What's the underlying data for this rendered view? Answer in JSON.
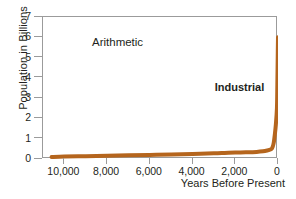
{
  "chart_data": {
    "type": "line",
    "title": "",
    "annotations": [
      {
        "text": "Arithmetic",
        "bold": false
      },
      {
        "text": "Industrial",
        "bold": true
      }
    ],
    "xlabel": "Years Before Present",
    "ylabel": "Population in Billions",
    "xlim": [
      11000,
      0
    ],
    "ylim": [
      0,
      7
    ],
    "x_reversed": true,
    "grid": false,
    "legend": "none",
    "xticks": [
      {
        "value": 10000,
        "label": "10,000"
      },
      {
        "value": 8000,
        "label": "8,000"
      },
      {
        "value": 6000,
        "label": "6,000"
      },
      {
        "value": 4000,
        "label": "4,000"
      },
      {
        "value": 2000,
        "label": "2,000"
      },
      {
        "value": 0,
        "label": "0"
      }
    ],
    "yticks": [
      {
        "value": 0,
        "label": "0"
      },
      {
        "value": 1,
        "label": "1"
      },
      {
        "value": 2,
        "label": "2"
      },
      {
        "value": 3,
        "label": "3"
      },
      {
        "value": 4,
        "label": "4"
      },
      {
        "value": 5,
        "label": "5"
      },
      {
        "value": 6,
        "label": "6"
      },
      {
        "value": 7,
        "label": "7"
      }
    ],
    "series": [
      {
        "name": "World population",
        "color": "#b5651d",
        "line_width": 4,
        "x": [
          10600,
          10000,
          9000,
          8000,
          7000,
          6000,
          5000,
          4000,
          3000,
          2500,
          2000,
          1500,
          1000,
          700,
          500,
          400,
          300,
          250,
          200,
          150,
          100,
          50,
          30,
          10,
          0
        ],
        "y": [
          0.1,
          0.12,
          0.14,
          0.16,
          0.18,
          0.2,
          0.22,
          0.25,
          0.28,
          0.3,
          0.32,
          0.33,
          0.35,
          0.38,
          0.42,
          0.45,
          0.5,
          0.6,
          0.8,
          1.2,
          1.7,
          2.5,
          3.7,
          5.3,
          6.0
        ]
      }
    ]
  },
  "axis": {
    "frame_color": "#9b9b9b"
  }
}
